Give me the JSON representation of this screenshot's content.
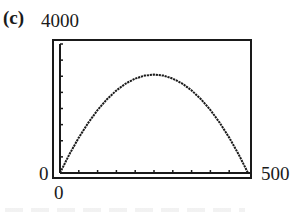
{
  "panel": {
    "label": "(c)"
  },
  "axes": {
    "y_max_label": "4000",
    "y_min_label": "0",
    "x_min_label": "0",
    "x_max_label": "500"
  },
  "colors": {
    "ink": "#1a1a1a",
    "background": "#ffffff"
  },
  "chart_data": {
    "type": "line",
    "title": "(c)",
    "xlabel": "",
    "ylabel": "",
    "xlim": [
      0,
      500
    ],
    "ylim": [
      0,
      4000
    ],
    "x_ticks_step": 50,
    "y_ticks_step": 500,
    "grid": false,
    "legend": null,
    "style": "graphing-calculator window, dotted/pixelated curve",
    "series": [
      {
        "name": "curve",
        "description": "downward parabola through (0,0) and (500,0), max ≈ 3050 at x = 250",
        "x": [
          0,
          25,
          50,
          75,
          100,
          125,
          150,
          175,
          200,
          225,
          250,
          275,
          300,
          325,
          350,
          375,
          400,
          425,
          450,
          475,
          500
        ],
        "y": [
          0,
          580,
          1098,
          1555,
          1952,
          2288,
          2562,
          2776,
          2928,
          3020,
          3050,
          3020,
          2928,
          2776,
          2562,
          2288,
          1952,
          1555,
          1098,
          580,
          0
        ]
      }
    ]
  }
}
